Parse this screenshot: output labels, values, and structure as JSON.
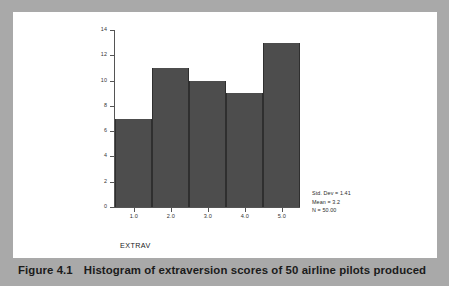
{
  "figure": {
    "caption_label": "Figure 4.1",
    "caption_text": "Histogram of extraversion scores of 50 airline pilots produced"
  },
  "colors": {
    "page_background": "#a9a9a9",
    "card_background": "#ffffff",
    "bar_fill": "#4d4d4d",
    "bar_edge": "#2f2f2f",
    "axis": "#555555",
    "text": "#1b1b1b"
  },
  "stats": {
    "std_dev": "Std. Dev = 1.41",
    "mean": "Mean = 3.2",
    "n": "N = 50.00"
  },
  "chart_data": {
    "type": "bar",
    "title": "",
    "subtitle": "",
    "xlabel": "EXTRAV",
    "ylabel": "",
    "categories": [
      "1.0",
      "2.0",
      "3.0",
      "4.0",
      "5.0"
    ],
    "values": [
      7,
      11,
      10,
      9,
      13
    ],
    "xlim": [
      0.5,
      5.5
    ],
    "ylim": [
      0,
      14
    ],
    "yticks": [
      0,
      2,
      4,
      6,
      8,
      10,
      12,
      14
    ],
    "ytick_labels": [
      "0",
      "2",
      "4",
      "6",
      "8",
      "10",
      "12",
      "14"
    ],
    "xtick_labels": [
      "1.0",
      "2.0",
      "3.0",
      "4.0",
      "5.0"
    ],
    "grid": false,
    "legend": "none",
    "annotations": [
      "Std. Dev = 1.41",
      "Mean = 3.2",
      "N = 50.00"
    ]
  }
}
